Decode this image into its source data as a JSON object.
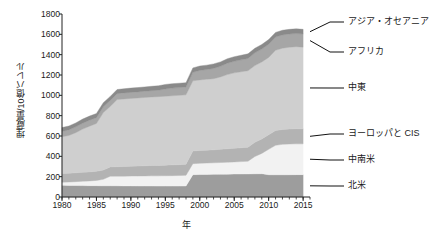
{
  "chart_data": {
    "type": "area",
    "stacked": true,
    "title": "",
    "subtitle": "",
    "xlabel": "年",
    "ylabel": "埋蔵量/10億バレル",
    "xlim": [
      1980,
      2016
    ],
    "ylim": [
      0,
      1800
    ],
    "grid": false,
    "legend_position": "right-callouts",
    "xticks": [
      1980,
      1985,
      1990,
      1995,
      2000,
      2005,
      2010,
      2015
    ],
    "xtick_labels": [
      "1980",
      "1985",
      "1990",
      "1995",
      "2000",
      "2005",
      "2010",
      "2015"
    ],
    "yticks": [
      0,
      200,
      400,
      600,
      800,
      1000,
      1200,
      1400,
      1600,
      1800
    ],
    "ytick_labels": [
      "0",
      "200",
      "400",
      "600",
      "800",
      "1000",
      "1200",
      "1400",
      "1600",
      "1800"
    ],
    "x": [
      1980,
      1981,
      1982,
      1983,
      1984,
      1985,
      1986,
      1987,
      1988,
      1989,
      1990,
      1991,
      1992,
      1993,
      1994,
      1995,
      1996,
      1997,
      1998,
      1999,
      2000,
      2001,
      2002,
      2003,
      2004,
      2005,
      2006,
      2007,
      2008,
      2009,
      2010,
      2011,
      2012,
      2013,
      2014,
      2015
    ],
    "series": [
      {
        "name": "北米",
        "name_en": "North America",
        "color": "#9d9d9d",
        "values": [
          115,
          114,
          113,
          112,
          111,
          111,
          110,
          110,
          110,
          109,
          109,
          108,
          108,
          108,
          107,
          107,
          107,
          107,
          108,
          220,
          221,
          222,
          223,
          224,
          225,
          226,
          226,
          227,
          228,
          229,
          219,
          218,
          218,
          219,
          220,
          220
        ]
      },
      {
        "name": "中南米",
        "name_en": "Central and South America",
        "color": "#f2f2f2",
        "values": [
          30,
          33,
          38,
          43,
          47,
          52,
          64,
          94,
          95,
          96,
          97,
          98,
          99,
          100,
          101,
          102,
          103,
          104,
          105,
          108,
          110,
          112,
          113,
          115,
          117,
          119,
          122,
          125,
          170,
          200,
          250,
          290,
          300,
          302,
          303,
          303
        ]
      },
      {
        "name": "ヨーロッパと CIS",
        "name_en": "Europe and CIS",
        "color": "#b3b3b3",
        "values": [
          85,
          86,
          87,
          88,
          89,
          90,
          91,
          92,
          93,
          95,
          97,
          98,
          100,
          102,
          103,
          104,
          106,
          107,
          108,
          125,
          126,
          127,
          128,
          130,
          132,
          134,
          136,
          138,
          140,
          142,
          144,
          145,
          146,
          147,
          148,
          148
        ]
      },
      {
        "name": "中東",
        "name_en": "Middle East",
        "color": "#cfcfcf",
        "values": [
          362,
          372,
          395,
          425,
          450,
          470,
          565,
          595,
          660,
          665,
          667,
          670,
          672,
          674,
          676,
          678,
          680,
          682,
          684,
          690,
          695,
          697,
          700,
          712,
          730,
          742,
          748,
          752,
          755,
          757,
          760,
          790,
          800,
          805,
          808,
          803
        ]
      },
      {
        "name": "アフリカ",
        "name_en": "Africa",
        "color": "#a6a6a6",
        "values": [
          53,
          55,
          57,
          58,
          58,
          57,
          58,
          58,
          58,
          59,
          59,
          60,
          61,
          62,
          63,
          72,
          75,
          76,
          77,
          84,
          93,
          96,
          101,
          104,
          112,
          114,
          117,
          121,
          125,
          127,
          129,
          130,
          130,
          130,
          129,
          129
        ]
      },
      {
        "name": "アジア・オセアニア",
        "name_en": "Asia Oceania",
        "color": "#8a8a8a",
        "values": [
          38,
          38,
          39,
          40,
          41,
          41,
          40,
          40,
          41,
          41,
          42,
          42,
          43,
          43,
          44,
          44,
          44,
          43,
          43,
          43,
          43,
          43,
          44,
          44,
          44,
          45,
          45,
          45,
          45,
          45,
          46,
          46,
          46,
          46,
          46,
          46
        ]
      }
    ],
    "callouts": [
      {
        "label": "アジア・オセアニア",
        "series": "アジア・オセアニア"
      },
      {
        "label": "アフリカ",
        "series": "アフリカ"
      },
      {
        "label": "中東",
        "series": "中東"
      },
      {
        "label": "ヨーロッパと CIS",
        "series": "ヨーロッパと CIS"
      },
      {
        "label": "中南米",
        "series": "中南米"
      },
      {
        "label": "北米",
        "series": "北米"
      }
    ]
  },
  "axes": {
    "y_title": "埋蔵量/10億バレル",
    "x_title": "年"
  }
}
